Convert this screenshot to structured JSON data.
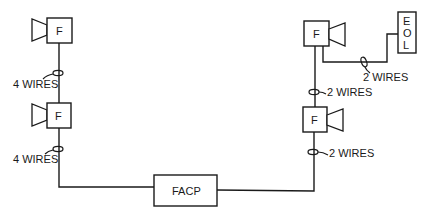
{
  "diagram": {
    "type": "fire alarm notification appliance wiring diagram",
    "colors": {
      "line": "#1a1a1a",
      "background": "#ffffff"
    },
    "control_panel": {
      "label": "FACP"
    },
    "end_of_line": {
      "label_letters": [
        "E",
        "O",
        "L"
      ]
    },
    "left_circuit": {
      "devices": [
        {
          "label": "F",
          "icon": "horn-icon"
        },
        {
          "label": "F",
          "icon": "horn-icon"
        }
      ],
      "wire_labels": [
        "4 WIRES",
        "4 WIRES"
      ]
    },
    "right_circuit": {
      "devices": [
        {
          "label": "F",
          "icon": "horn-icon"
        },
        {
          "label": "F",
          "icon": "horn-icon"
        }
      ],
      "wire_labels": [
        "2 WIRES",
        "2 WIRES",
        "2 WIRES"
      ]
    }
  }
}
